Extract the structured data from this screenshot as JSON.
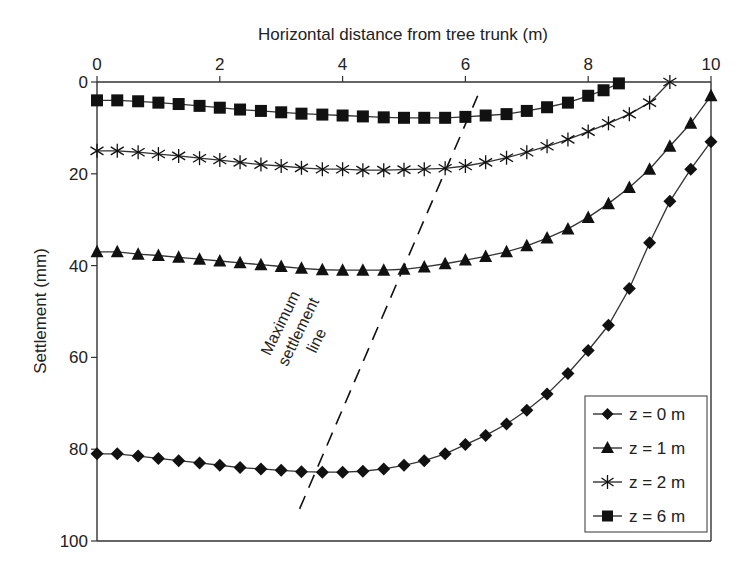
{
  "chart_data": {
    "type": "line",
    "title": "",
    "xlabel": "Horizontal distance from tree trunk (m)",
    "ylabel": "Settlement (mm)",
    "xlim": [
      0,
      10
    ],
    "ylim": [
      100,
      0
    ],
    "x_axis_position": "top",
    "y_inverted": true,
    "xticks": [
      0,
      2,
      4,
      6,
      8,
      10
    ],
    "yticks": [
      0,
      20,
      40,
      60,
      80,
      100
    ],
    "grid": false,
    "legend_position": "lower right",
    "series": [
      {
        "name": "z = 0 m",
        "marker": "diamond",
        "x": [
          0,
          0.33,
          0.67,
          1,
          1.33,
          1.67,
          2,
          2.33,
          2.67,
          3,
          3.33,
          3.67,
          4,
          4.33,
          4.67,
          5,
          5.33,
          5.67,
          6,
          6.33,
          6.67,
          7,
          7.33,
          7.67,
          8,
          8.33,
          8.67,
          9,
          9.33,
          9.67,
          10
        ],
        "values": [
          81,
          81,
          81.5,
          82,
          82.5,
          83,
          83.5,
          84,
          84.3,
          84.6,
          84.9,
          85,
          85,
          84.8,
          84.3,
          83.5,
          82.5,
          81,
          79,
          77,
          74.5,
          71.5,
          68,
          63.5,
          58.5,
          53,
          45,
          35,
          26,
          19,
          13
        ]
      },
      {
        "name": "z = 1 m",
        "marker": "triangle",
        "x": [
          0,
          0.33,
          0.67,
          1,
          1.33,
          1.67,
          2,
          2.33,
          2.67,
          3,
          3.33,
          3.67,
          4,
          4.33,
          4.67,
          5,
          5.33,
          5.67,
          6,
          6.33,
          6.67,
          7,
          7.33,
          7.67,
          8,
          8.33,
          8.67,
          9,
          9.33,
          9.67,
          10
        ],
        "values": [
          37,
          37,
          37.5,
          37.8,
          38.2,
          38.6,
          39,
          39.4,
          39.8,
          40.2,
          40.6,
          40.9,
          41,
          41,
          41,
          40.8,
          40.3,
          39.6,
          38.8,
          38,
          37,
          35.7,
          34,
          32,
          29.5,
          26.5,
          23,
          19,
          14,
          9,
          3
        ]
      },
      {
        "name": "z = 2 m",
        "marker": "asterisk",
        "x": [
          0,
          0.33,
          0.67,
          1,
          1.33,
          1.67,
          2,
          2.33,
          2.67,
          3,
          3.33,
          3.67,
          4,
          4.33,
          4.67,
          5,
          5.33,
          5.67,
          6,
          6.33,
          6.67,
          7,
          7.33,
          7.67,
          8,
          8.33,
          8.67,
          9,
          9.33
        ],
        "values": [
          15,
          15,
          15.3,
          15.7,
          16.1,
          16.6,
          17,
          17.5,
          18,
          18.3,
          18.7,
          19,
          19,
          19.2,
          19.2,
          19.1,
          19,
          18.8,
          18.3,
          17.5,
          16.5,
          15.3,
          14,
          12.5,
          10.8,
          9,
          7,
          4.5,
          0
        ]
      },
      {
        "name": "z = 6 m",
        "marker": "square",
        "x": [
          0,
          0.33,
          0.67,
          1,
          1.33,
          1.67,
          2,
          2.33,
          2.67,
          3,
          3.33,
          3.67,
          4,
          4.33,
          4.67,
          5,
          5.33,
          5.67,
          6,
          6.33,
          6.67,
          7,
          7.33,
          7.67,
          8,
          8.25,
          8.5
        ],
        "values": [
          4,
          4,
          4.2,
          4.5,
          4.8,
          5.2,
          5.6,
          6,
          6.3,
          6.6,
          6.9,
          7.1,
          7.3,
          7.5,
          7.7,
          7.8,
          7.8,
          7.8,
          7.6,
          7.3,
          7,
          6.3,
          5.5,
          4.5,
          3,
          1.8,
          0.3
        ]
      }
    ],
    "annotations": [
      {
        "text": [
          "Maximum",
          "settlement",
          "line"
        ],
        "type": "dashed-line",
        "from": [
          3.3,
          93
        ],
        "to": [
          6.2,
          3
        ]
      }
    ]
  },
  "labels": {
    "xlabel": "Horizontal distance from tree trunk (m)",
    "ylabel": "Settlement (mm)",
    "annotation_lines": [
      "Maximum",
      "settlement",
      "line"
    ],
    "legend": [
      "z = 0 m",
      "z = 1 m",
      "z = 2 m",
      "z = 6 m"
    ]
  }
}
